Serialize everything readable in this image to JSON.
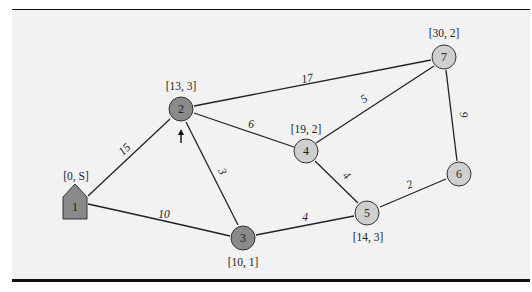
{
  "diagram": {
    "type": "weighted-undirected-graph",
    "colors": {
      "background": "#f2f2f2",
      "rule": "#111111",
      "edge": "#222222",
      "node_dark": "#8a8a8a",
      "node_light": "#cfcfcf",
      "node_stroke": "#333333"
    },
    "nodes": [
      {
        "id": "1",
        "label": "1",
        "coord_label": "[0, S]",
        "shape": "house",
        "fill": "dark",
        "x": 75,
        "y": 206
      },
      {
        "id": "2",
        "label": "2",
        "coord_label": "[13, 3]",
        "shape": "circle",
        "fill": "dark",
        "x": 181,
        "y": 109
      },
      {
        "id": "3",
        "label": "3",
        "coord_label": "[10, 1]",
        "shape": "circle",
        "fill": "dark",
        "x": 243,
        "y": 238
      },
      {
        "id": "4",
        "label": "4",
        "coord_label": "[19, 2]",
        "shape": "circle",
        "fill": "light",
        "x": 306,
        "y": 151
      },
      {
        "id": "5",
        "label": "5",
        "coord_label": "[14, 3]",
        "shape": "circle",
        "fill": "light",
        "x": 367,
        "y": 213
      },
      {
        "id": "6",
        "label": "6",
        "coord_label": "",
        "shape": "circle",
        "fill": "light",
        "x": 459,
        "y": 174
      },
      {
        "id": "7",
        "label": "7",
        "coord_label": "[30, 2]",
        "shape": "circle",
        "fill": "light",
        "x": 444,
        "y": 57
      }
    ],
    "edges": [
      {
        "from": "1",
        "to": "2",
        "weight": "15"
      },
      {
        "from": "1",
        "to": "3",
        "weight": "10"
      },
      {
        "from": "2",
        "to": "3",
        "weight": "3"
      },
      {
        "from": "2",
        "to": "4",
        "weight": "6"
      },
      {
        "from": "2",
        "to": "7",
        "weight": "17"
      },
      {
        "from": "3",
        "to": "5",
        "weight": "4"
      },
      {
        "from": "4",
        "to": "5",
        "weight": "4"
      },
      {
        "from": "4",
        "to": "7",
        "weight": "5"
      },
      {
        "from": "5",
        "to": "6",
        "weight": "2"
      },
      {
        "from": "6",
        "to": "7",
        "weight": "9"
      }
    ],
    "annotations": [
      {
        "name": "current-node-arrow",
        "glyph": "up-arrow",
        "target": "2"
      }
    ]
  }
}
